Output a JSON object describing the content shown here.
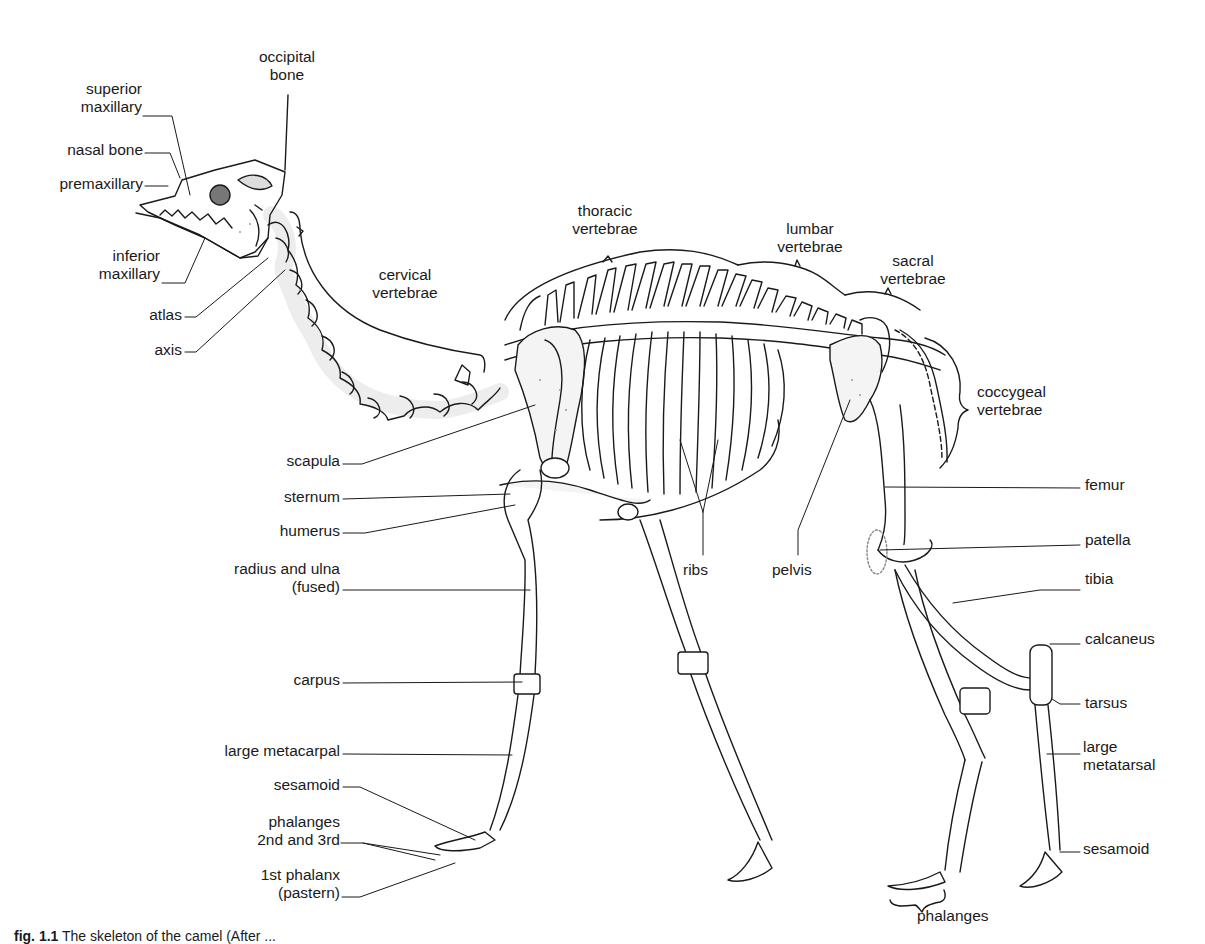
{
  "figure": {
    "caption_label": "fig. 1.1",
    "caption_text": "The skeleton of the camel (After ..."
  },
  "labels": {
    "occipital_bone": [
      "occipital",
      "bone"
    ],
    "superior_maxillary": [
      "superior",
      "maxillary"
    ],
    "nasal_bone": "nasal bone",
    "premaxillary": "premaxillary",
    "inferior_maxillary": [
      "inferior",
      "maxillary"
    ],
    "atlas": "atlas",
    "axis": "axis",
    "cervical_vertebrae": [
      "cervical",
      "vertebrae"
    ],
    "thoracic_vertebrae": [
      "thoracic",
      "vertebrae"
    ],
    "lumbar_vertebrae": [
      "lumbar",
      "vertebrae"
    ],
    "sacral_vertebrae": [
      "sacral",
      "vertebrae"
    ],
    "coccygeal_vertebrae": [
      "coccygeal",
      "vertebrae"
    ],
    "scapula": "scapula",
    "sternum": "sternum",
    "humerus": "humerus",
    "radius_ulna": [
      "radius and ulna",
      "(fused)"
    ],
    "carpus": "carpus",
    "large_metacarpal": "large metacarpal",
    "sesamoid_front": "sesamoid",
    "phalanges_2nd_3rd": [
      "phalanges",
      "2nd and 3rd"
    ],
    "first_phalanx": [
      "1st phalanx",
      "(pastern)"
    ],
    "ribs": "ribs",
    "pelvis": "pelvis",
    "femur": "femur",
    "patella": "patella",
    "tibia": "tibia",
    "calcaneus": "calcaneus",
    "tarsus": "tarsus",
    "large_metatarsal": [
      "large",
      "metatarsal"
    ],
    "sesamoid_hind": "sesamoid",
    "phalanges_hind": "phalanges"
  },
  "colors": {
    "ink": "#1a1a1a",
    "stipple": "#8a8a8a",
    "background": "#ffffff"
  }
}
